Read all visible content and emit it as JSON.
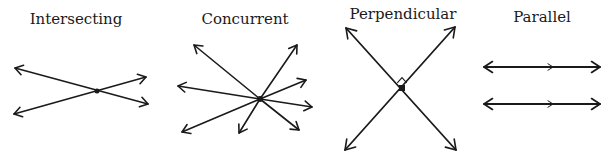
{
  "panels": [
    {
      "id": "intersecting",
      "title": "Intersecting",
      "title_x": 76,
      "title_y": 10
    },
    {
      "id": "concurrent",
      "title": "Concurrent",
      "title_x": 245,
      "title_y": 10
    },
    {
      "id": "perpendicular",
      "title": "Perpendicular",
      "title_x": 403,
      "title_y": 5
    },
    {
      "id": "parallel",
      "title": "Parallel",
      "title_x": 542,
      "title_y": 8
    }
  ],
  "colors": {
    "stroke": "#1a1a1a",
    "background": "#ffffff"
  },
  "figures": {
    "intersecting": {
      "center": [
        97,
        91
      ],
      "lines": [
        [
          [
            15,
            68
          ],
          [
            148,
            104
          ]
        ],
        [
          [
            14,
            114
          ],
          [
            146,
            77
          ]
        ]
      ]
    },
    "concurrent": {
      "center": [
        260,
        99
      ],
      "rays": [
        [
          194,
          45
        ],
        [
          297,
          45
        ],
        [
          178,
          86
        ],
        [
          306,
          80
        ],
        [
          312,
          107
        ],
        [
          182,
          132
        ],
        [
          239,
          133
        ],
        [
          299,
          130
        ]
      ]
    },
    "perpendicular": {
      "center": [
        402,
        88
      ],
      "lines": [
        [
          [
            346,
            28
          ],
          [
            456,
            150
          ]
        ],
        [
          [
            455,
            27
          ],
          [
            345,
            150
          ]
        ]
      ],
      "right_angle_marker": true
    },
    "parallel": {
      "lines": [
        {
          "y": 67,
          "x1": 484,
          "x2": 600,
          "mid_arrow_x": 553
        },
        {
          "y": 104,
          "x1": 484,
          "x2": 600,
          "mid_arrow_x": 553
        }
      ]
    }
  }
}
